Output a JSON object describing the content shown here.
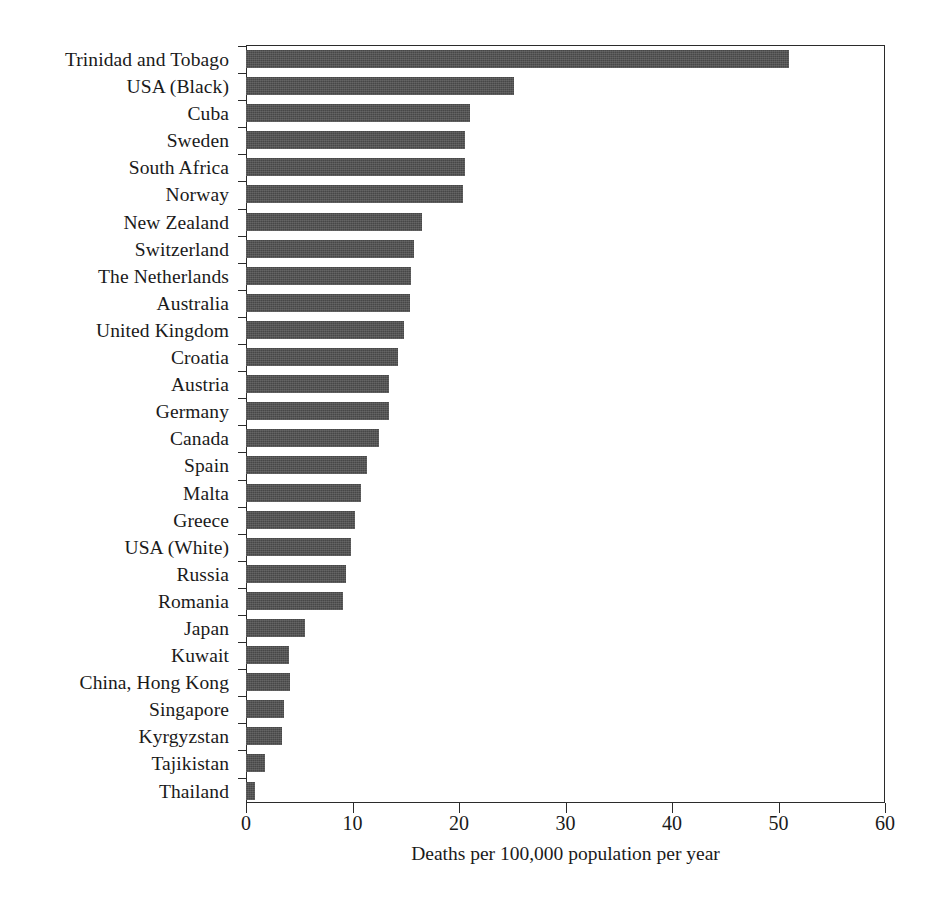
{
  "chart_data": {
    "type": "bar",
    "orientation": "horizontal",
    "title": "",
    "xlabel": "Deaths per 100,000 population per year",
    "ylabel": "",
    "xlim": [
      0,
      60
    ],
    "xticks": [
      0,
      10,
      20,
      30,
      40,
      50,
      60
    ],
    "grid": false,
    "legend": null,
    "bar_color": "#474747",
    "categories": [
      "Trinidad and Tobago",
      "USA (Black)",
      "Cuba",
      "Sweden",
      "South Africa",
      "Norway",
      "New Zealand",
      "Switzerland",
      "The Netherlands",
      "Australia",
      "United Kingdom",
      "Croatia",
      "Austria",
      "Germany",
      "Canada",
      "Spain",
      "Malta",
      "Greece",
      "USA (White)",
      "Russia",
      "Romania",
      "Japan",
      "Kuwait",
      "China, Hong Kong",
      "Singapore",
      "Kyrgyzstan",
      "Tajikistan",
      "Thailand"
    ],
    "values": [
      51.0,
      25.2,
      21.0,
      20.6,
      20.6,
      20.4,
      16.5,
      15.8,
      15.5,
      15.4,
      14.8,
      14.3,
      13.4,
      13.4,
      12.5,
      11.4,
      10.8,
      10.2,
      9.9,
      9.4,
      9.1,
      5.5,
      4.0,
      4.1,
      3.6,
      3.4,
      1.8,
      0.8
    ]
  }
}
